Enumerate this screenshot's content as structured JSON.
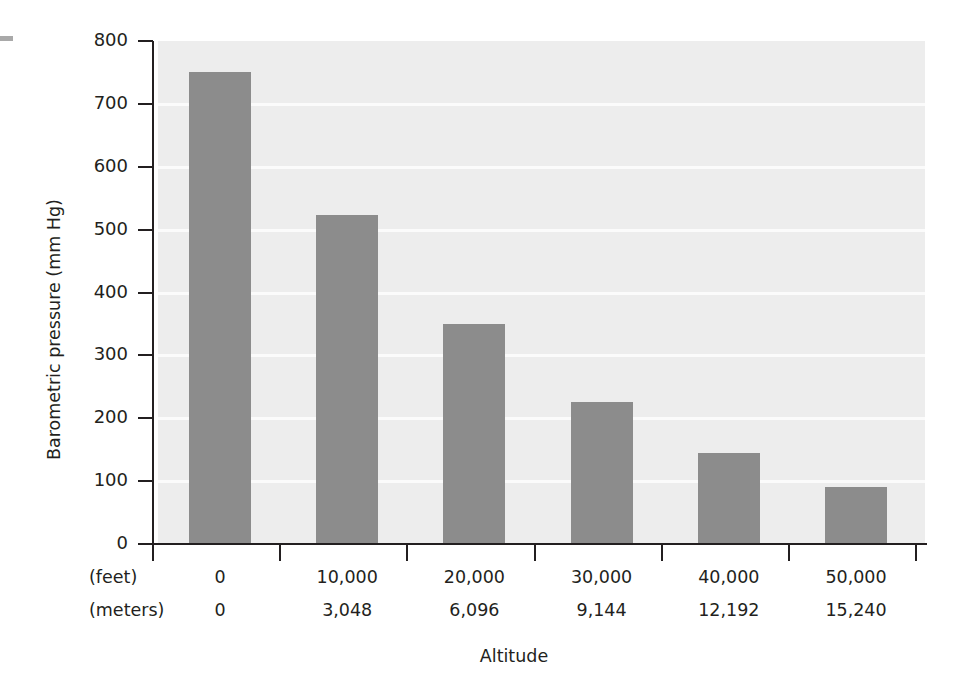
{
  "figure": {
    "width": 968,
    "height": 697,
    "background": "#ffffff",
    "edge_mark_color": "#a9a9a9"
  },
  "chart_data": {
    "type": "bar",
    "title": "",
    "xlabel": "Altitude",
    "ylabel": "Barometric pressure (mm Hg)",
    "categories": [
      "0",
      "10,000",
      "20,000",
      "30,000",
      "40,000",
      "50,000"
    ],
    "categories_secondary": [
      "0",
      "3,048",
      "6,096",
      "9,144",
      "12,192",
      "15,240"
    ],
    "category_unit_primary": "(feet)",
    "category_unit_secondary": "(meters)",
    "values": [
      750,
      523,
      350,
      226,
      144,
      91
    ],
    "ylim": [
      0,
      800
    ],
    "ytick_labels": [
      "800",
      "700",
      "600",
      "500",
      "400",
      "300",
      "200",
      "100",
      "0"
    ],
    "ytick_values": [
      800,
      700,
      600,
      500,
      400,
      300,
      200,
      100,
      0
    ],
    "grid": true,
    "grid_color": "#fbfbfb",
    "plot_background": "#ededed",
    "bar_color": "#8c8c8c",
    "axis_color": "#231f20",
    "legend": null,
    "legend_position": "none"
  }
}
